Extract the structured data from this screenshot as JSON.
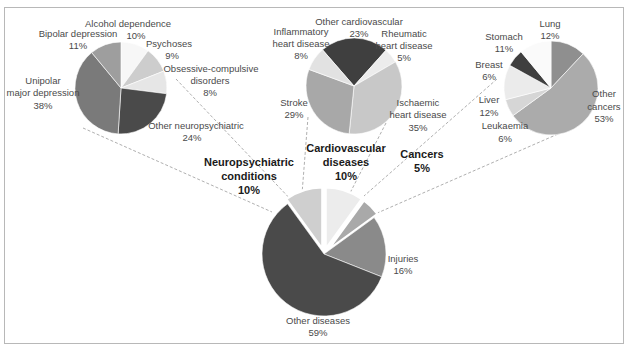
{
  "chart_data": [
    {
      "type": "pie",
      "title": "Global burden by cause (main pie)",
      "name": "main",
      "center": [
        324,
        254
      ],
      "radius": 62,
      "categories": [
        "Neuropsychiatric conditions",
        "Cardiovascular diseases",
        "Cancers",
        "Injuries",
        "Other diseases"
      ],
      "values": [
        10,
        10,
        5,
        16,
        59
      ],
      "exploded": [
        true,
        true,
        true,
        false,
        false
      ],
      "start_deg": -36,
      "colors": [
        "#cfcfcf",
        "#ececec",
        "#a9a9a9",
        "#8a8a8a",
        "#4a4a4a"
      ]
    },
    {
      "type": "pie",
      "name": "neuropsychiatric",
      "title": "Neuropsychiatric conditions 10%",
      "center": [
        121,
        88
      ],
      "radius": 46,
      "categories": [
        "Alcohol dependence",
        "Psychoses",
        "Obsessive-compulsive disorders",
        "Other neuropsychiatric",
        "Unipolar major depression",
        "Bipolar depression"
      ],
      "values": [
        10,
        9,
        8,
        24,
        38,
        11
      ],
      "start_deg": 0,
      "colors": [
        "#f7f7f7",
        "#cdcdcd",
        "#e6e6e6",
        "#4a4a4a",
        "#7a7a7a",
        "#9e9e9e"
      ]
    },
    {
      "type": "pie",
      "name": "cardiovascular",
      "title": "Cardiovascular diseases 10%",
      "center": [
        354,
        86
      ],
      "radius": 48,
      "categories": [
        "Other cardiovascular",
        "Rheumatic heart disease",
        "Ischaemic heart disease",
        "Stroke",
        "Inflammatory heart disease"
      ],
      "values": [
        23,
        5,
        35,
        29,
        8
      ],
      "start_deg": -41,
      "colors": [
        "#3f3f3f",
        "#ececec",
        "#c8c8c8",
        "#a8a8a8",
        "#e2e2e2"
      ]
    },
    {
      "type": "pie",
      "name": "cancers",
      "title": "Cancers 5%",
      "center": [
        551,
        88
      ],
      "radius": 47,
      "categories": [
        "Lung",
        "Other cancers",
        "Leukaemia",
        "Liver",
        "Breast",
        "Stomach"
      ],
      "values": [
        12,
        53,
        6,
        12,
        6,
        11
      ],
      "start_deg": 0,
      "colors": [
        "#8f8f8f",
        "#ababab",
        "#d6d6d6",
        "#ebebeb",
        "#3f3f3f",
        "#fafafa"
      ]
    }
  ],
  "labels": [
    {
      "text": "Alcohol dependence",
      "x": 128,
      "y": 27,
      "anchor": "middle"
    },
    {
      "text": "10%",
      "x": 136,
      "y": 39,
      "anchor": "middle"
    },
    {
      "text": "Bipolar depression",
      "x": 78,
      "y": 37,
      "anchor": "middle"
    },
    {
      "text": "11%",
      "x": 78,
      "y": 49,
      "anchor": "middle"
    },
    {
      "text": "Psychoses",
      "x": 169,
      "y": 47,
      "anchor": "middle"
    },
    {
      "text": "9%",
      "x": 172,
      "y": 59,
      "anchor": "middle"
    },
    {
      "text": "Obsessive-compulsive",
      "x": 211,
      "y": 72,
      "anchor": "middle"
    },
    {
      "text": "disorders",
      "x": 210,
      "y": 84,
      "anchor": "middle"
    },
    {
      "text": "8%",
      "x": 210,
      "y": 96,
      "anchor": "middle"
    },
    {
      "text": "Unipolar",
      "x": 43,
      "y": 84,
      "anchor": "middle"
    },
    {
      "text": "major depression",
      "x": 43,
      "y": 96,
      "anchor": "middle"
    },
    {
      "text": "38%",
      "x": 43,
      "y": 109,
      "anchor": "middle"
    },
    {
      "text": "Other neuropsychiatric",
      "x": 196,
      "y": 129,
      "anchor": "middle"
    },
    {
      "text": "24%",
      "x": 192,
      "y": 141,
      "anchor": "middle"
    },
    {
      "text": "Other cardiovascular",
      "x": 359,
      "y": 25,
      "anchor": "middle"
    },
    {
      "text": "23%",
      "x": 359,
      "y": 37,
      "anchor": "middle"
    },
    {
      "text": "Inflammatory",
      "x": 301,
      "y": 35,
      "anchor": "middle"
    },
    {
      "text": "heart disease",
      "x": 301,
      "y": 47,
      "anchor": "middle"
    },
    {
      "text": "8%",
      "x": 301,
      "y": 59,
      "anchor": "middle"
    },
    {
      "text": "Rheumatic",
      "x": 404,
      "y": 37,
      "anchor": "middle"
    },
    {
      "text": "heart disease",
      "x": 404,
      "y": 49,
      "anchor": "middle"
    },
    {
      "text": "5%",
      "x": 404,
      "y": 61,
      "anchor": "middle"
    },
    {
      "text": "Stroke",
      "x": 294,
      "y": 106,
      "anchor": "middle"
    },
    {
      "text": "29%",
      "x": 294,
      "y": 118,
      "anchor": "middle"
    },
    {
      "text": "Ischaemic",
      "x": 418,
      "y": 106,
      "anchor": "middle"
    },
    {
      "text": "heart disease",
      "x": 418,
      "y": 118,
      "anchor": "middle"
    },
    {
      "text": "35%",
      "x": 418,
      "y": 131,
      "anchor": "middle"
    },
    {
      "text": "Lung",
      "x": 550,
      "y": 27,
      "anchor": "middle"
    },
    {
      "text": "12%",
      "x": 550,
      "y": 39,
      "anchor": "middle"
    },
    {
      "text": "Stomach",
      "x": 504,
      "y": 40,
      "anchor": "middle"
    },
    {
      "text": "11%",
      "x": 504,
      "y": 52,
      "anchor": "middle"
    },
    {
      "text": "Breast",
      "x": 489,
      "y": 68,
      "anchor": "middle"
    },
    {
      "text": "6%",
      "x": 489,
      "y": 80,
      "anchor": "middle"
    },
    {
      "text": "Liver",
      "x": 489,
      "y": 103,
      "anchor": "middle"
    },
    {
      "text": "12%",
      "x": 489,
      "y": 116,
      "anchor": "middle"
    },
    {
      "text": "Leukaemia",
      "x": 505,
      "y": 129,
      "anchor": "middle"
    },
    {
      "text": "6%",
      "x": 505,
      "y": 142,
      "anchor": "middle"
    },
    {
      "text": "Other",
      "x": 604,
      "y": 97,
      "anchor": "middle"
    },
    {
      "text": "cancers",
      "x": 604,
      "y": 110,
      "anchor": "middle"
    },
    {
      "text": "53%",
      "x": 604,
      "y": 122,
      "anchor": "middle"
    },
    {
      "text": "Injuries",
      "x": 403,
      "y": 262,
      "anchor": "middle"
    },
    {
      "text": "16%",
      "x": 403,
      "y": 274,
      "anchor": "middle"
    },
    {
      "text": "Other diseases",
      "x": 318,
      "y": 324,
      "anchor": "middle"
    },
    {
      "text": "59%",
      "x": 318,
      "y": 336,
      "anchor": "middle"
    }
  ],
  "group_labels": [
    {
      "lines": [
        "Neuropsychiatric",
        "conditions",
        "10%"
      ],
      "x": 249,
      "y": 166
    },
    {
      "lines": [
        "Cardiovascular",
        "diseases",
        "10%"
      ],
      "x": 346,
      "y": 152
    },
    {
      "lines": [
        "Cancers",
        "5%"
      ],
      "x": 422,
      "y": 158
    }
  ],
  "connectors": [
    {
      "x1": 176,
      "y1": 79,
      "x2": 296,
      "y2": 205
    },
    {
      "x1": 83,
      "y1": 128,
      "x2": 272,
      "y2": 212
    },
    {
      "x1": 308,
      "y1": 117,
      "x2": 302,
      "y2": 194
    },
    {
      "x1": 386,
      "y1": 123,
      "x2": 350,
      "y2": 193
    },
    {
      "x1": 497,
      "y1": 79,
      "x2": 364,
      "y2": 196
    },
    {
      "x1": 558,
      "y1": 134,
      "x2": 375,
      "y2": 214
    }
  ]
}
